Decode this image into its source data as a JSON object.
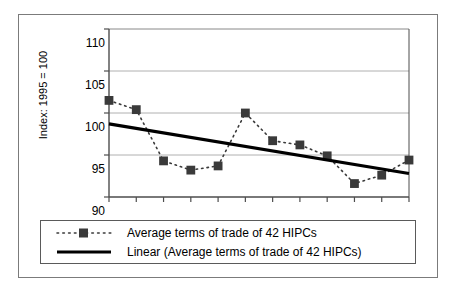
{
  "chart_data": {
    "type": "line",
    "title": "",
    "subtitle": "",
    "xlabel": "",
    "ylabel": "Index: 1995 = 100",
    "x": [
      1990,
      1991,
      1992,
      1993,
      1994,
      1995,
      1996,
      1997,
      1998,
      1999,
      2000,
      2001
    ],
    "xtick_labels": [
      "1990",
      "1992",
      "1994",
      "1996",
      "1998",
      "2000"
    ],
    "xtick_values": [
      1990,
      1992,
      1994,
      1996,
      1998,
      2000
    ],
    "xlim": [
      1990,
      2001
    ],
    "ytick_labels": [
      "90",
      "95",
      "100",
      "105",
      "110"
    ],
    "ytick_values": [
      90,
      95,
      100,
      105,
      110
    ],
    "ylim": [
      90,
      110
    ],
    "grid": "horizontal",
    "legend_position": "bottom",
    "series": [
      {
        "name": "Average terms of trade of 42 HIPCs",
        "style": "dotted-line-with-square-markers",
        "color": "#3a3a3a",
        "marker": "square",
        "values": [
          101.5,
          100.4,
          94.3,
          93.2,
          93.7,
          100.0,
          96.7,
          96.2,
          94.9,
          91.6,
          92.6,
          94.4
        ]
      },
      {
        "name": "Linear (Average terms of trade of 42 HIPCs)",
        "style": "solid-thick-line",
        "color": "#000000",
        "marker": "none",
        "values": [
          98.7,
          98.16,
          97.62,
          97.08,
          96.54,
          96.0,
          95.46,
          94.92,
          94.38,
          93.84,
          93.3,
          92.8
        ]
      }
    ]
  },
  "legend": {
    "items": [
      {
        "label": "Average terms of trade of 42 HIPCs",
        "key": "dotted-square-marker-key"
      },
      {
        "label": "Linear (Average terms of trade of 42 HIPCs)",
        "key": "solid-line-key"
      }
    ]
  },
  "axes": {
    "y_title": "Index: 1995 = 100",
    "y_ticks": [
      "110",
      "105",
      "100",
      "95",
      "90"
    ],
    "x_ticks": [
      "1990",
      "1992",
      "1994",
      "1996",
      "1998",
      "2000"
    ]
  },
  "colors": {
    "series_marker": "#3a3a3a",
    "trendline": "#000000",
    "gridline": "#b0b0b0",
    "axis": "#4d4d4d",
    "figure_border": "#7b7b7b",
    "legend_border": "#5a5a5a",
    "background": "#ffffff"
  }
}
